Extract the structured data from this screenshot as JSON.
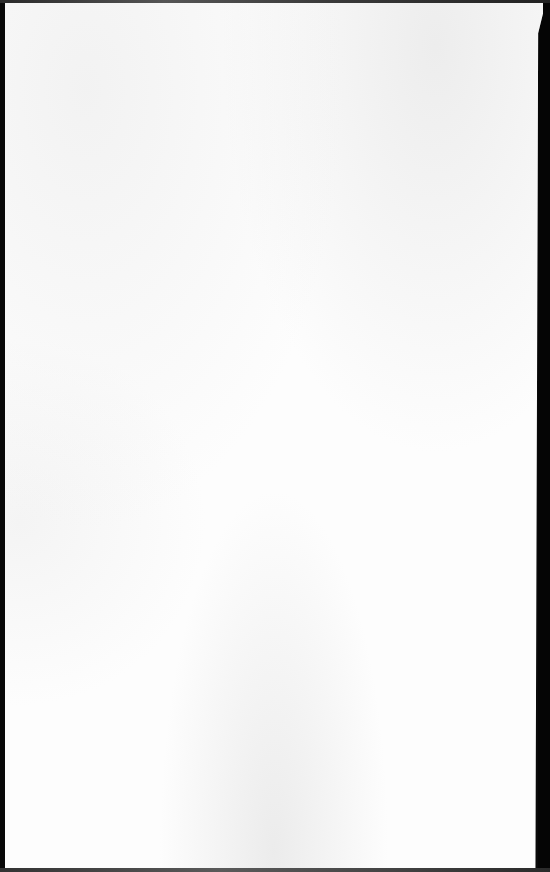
{
  "document": {
    "type": "blank-scanned-page",
    "content": "",
    "colors": {
      "paper": "#fdfdfd",
      "background": "#0a0a0a",
      "paper_shading": "#e8e8e8"
    }
  }
}
